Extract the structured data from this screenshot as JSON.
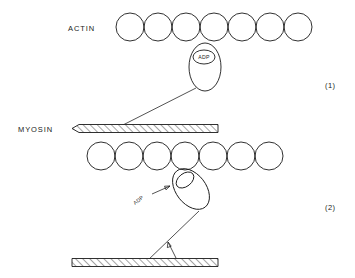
{
  "figure": {
    "background_color": "#ffffff",
    "line_color": "#1a1a1a",
    "width": 355,
    "height": 278
  },
  "labels": {
    "actin": "ACTIN",
    "myosin": "MYOSIN",
    "adp_bound": "ADP",
    "adp_released": "ADP"
  },
  "panels": [
    {
      "number": "(1)",
      "description": "Myosin head with bound ADP attached perpendicular to actin filament",
      "actin_circle_count": 7,
      "head_state": "upright",
      "nucleotide": "ADP",
      "nucleotide_visible": true
    },
    {
      "number": "(2)",
      "description": "Myosin head tilted after power stroke, ADP released",
      "actin_circle_count": 7,
      "head_state": "tilted",
      "nucleotide": "ADP",
      "nucleotide_visible": false
    }
  ],
  "geometry": {
    "actin_circle_radius": 14,
    "actin_circle_spacing": 28,
    "panel1_actin_y": 27,
    "panel1_actin_x_start": 130,
    "panel2_actin_y": 156,
    "panel2_actin_x_start": 101,
    "panel1_myosin_bar_y": 128,
    "panel2_myosin_bar_y": 262,
    "myosin_bar_height": 7
  }
}
